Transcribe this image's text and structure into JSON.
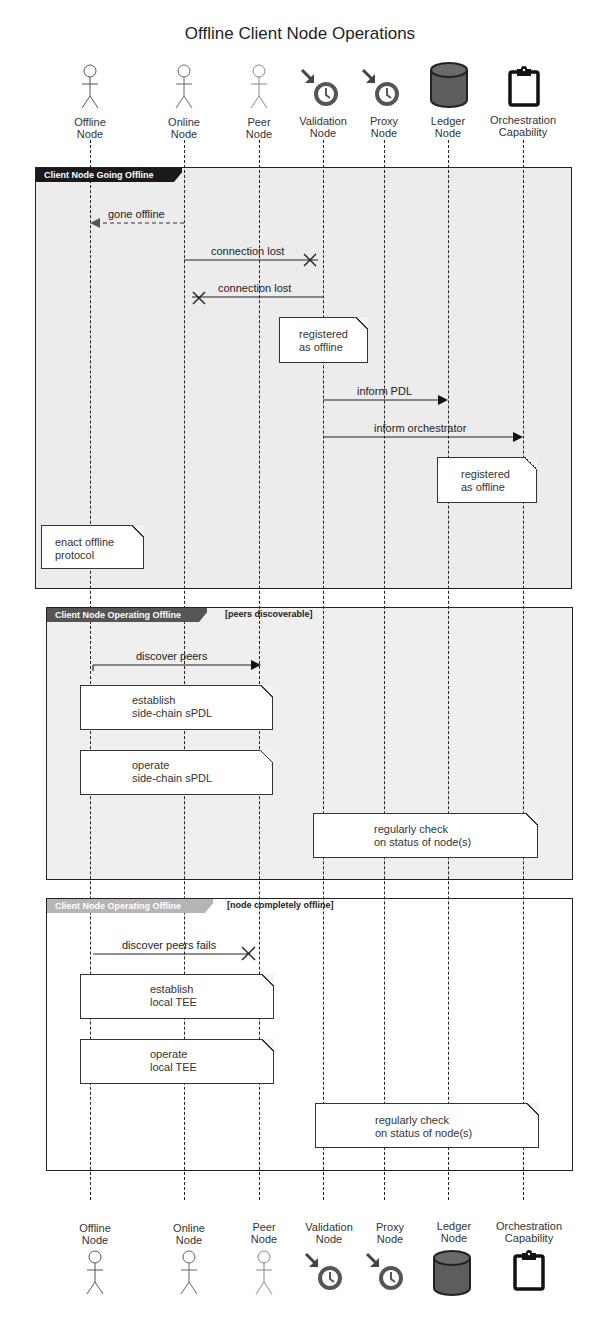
{
  "title": "Offline Client Node Operations",
  "participants": [
    {
      "id": "offline",
      "label": "Offline\nNode",
      "icon": "actor-icon",
      "x": 90
    },
    {
      "id": "online",
      "label": "Online\nNode",
      "icon": "actor-icon",
      "x": 184
    },
    {
      "id": "peer",
      "label": "Peer\nNode",
      "icon": "actor-icon",
      "x": 259
    },
    {
      "id": "validation",
      "label": "Validation\nNode",
      "icon": "clock-arrow-icon",
      "x": 323
    },
    {
      "id": "proxy",
      "label": "Proxy\nNode",
      "icon": "clock-arrow-icon",
      "x": 384
    },
    {
      "id": "ledger",
      "label": "Ledger\nNode",
      "icon": "database-icon",
      "x": 448
    },
    {
      "id": "orchestration",
      "label": "Orchestration\nCapability",
      "icon": "clipboard-icon",
      "x": 523
    }
  ],
  "frames": [
    {
      "label": "Client Node Going Offline",
      "guard": "",
      "tab_color": "#1a1a1a",
      "background": "#ececec",
      "messages": [
        {
          "label": "gone offline",
          "from": "online",
          "to": "offline",
          "style": "dashed",
          "head": "filled"
        },
        {
          "label": "connection lost",
          "from": "online",
          "to": "validation",
          "style": "solid",
          "head": "x"
        },
        {
          "label": "connection lost",
          "from": "validation",
          "to": "online",
          "style": "solid",
          "head": "x"
        },
        {
          "label": "inform PDL",
          "from": "validation",
          "to": "ledger",
          "style": "solid",
          "head": "filled"
        },
        {
          "label": "inform orchestrator",
          "from": "validation",
          "to": "orchestration",
          "style": "solid",
          "head": "filled"
        }
      ],
      "notes": [
        {
          "text": "registered\nas offline"
        },
        {
          "text": "registered\nas offline"
        },
        {
          "text": "enact offline\nprotocol"
        }
      ]
    },
    {
      "label": "Client Node Operating Offline",
      "guard": "[peers discoverable]",
      "tab_color": "#555555",
      "background": "#efefef",
      "messages": [
        {
          "label": "discover peers",
          "from": "offline",
          "to": "peer",
          "style": "solid",
          "head": "filled"
        }
      ],
      "notes": [
        {
          "text": "establish\nside-chain sPDL"
        },
        {
          "text": "operate\nside-chain sPDL"
        },
        {
          "text": "regularly check\non status of node(s)"
        }
      ]
    },
    {
      "label": "Client Node Operating Offline",
      "guard": "[node completely offline]",
      "tab_color": "#b5b5b5",
      "background": "#ffffff",
      "messages": [
        {
          "label": "discover peers fails",
          "from": "offline",
          "to": "peer",
          "style": "solid",
          "head": "x"
        }
      ],
      "notes": [
        {
          "text": "establish\nlocal TEE"
        },
        {
          "text": "operate\nlocal TEE"
        },
        {
          "text": "regularly check\non status of node(s)"
        }
      ]
    }
  ]
}
